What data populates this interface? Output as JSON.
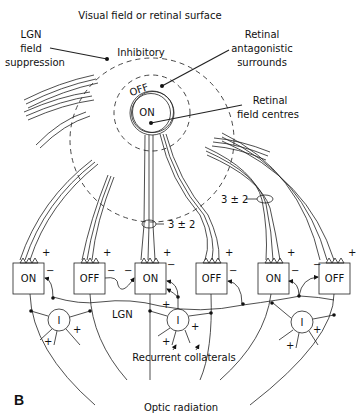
{
  "figure": {
    "panel_label": "B",
    "title": "Visual field or retinal surface",
    "labels": {
      "lgn_field_suppression": [
        "LGN",
        "field",
        "suppression"
      ],
      "inhibitory": "Inhibitory",
      "retinal_antagonistic_surrounds": [
        "Retinal",
        "antagonistic",
        "surrounds"
      ],
      "retinal_field_centres": [
        "Retinal",
        "field centres"
      ],
      "off_ring": "OFF",
      "on_center": "ON",
      "convergence_left": "3 ± 2",
      "convergence_right": "3 ± 2",
      "lgn": "LGN",
      "recurrent_collaterals": "Recurrent collaterals",
      "optic_radiation": "Optic radiation",
      "interneuron": "I",
      "plus": "+",
      "minus": "−"
    },
    "relay_cells": [
      {
        "label": "ON"
      },
      {
        "label": "OFF"
      },
      {
        "label": "ON"
      },
      {
        "label": "OFF"
      },
      {
        "label": "ON"
      },
      {
        "label": "OFF"
      }
    ]
  }
}
